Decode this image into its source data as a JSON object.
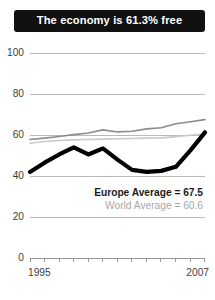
{
  "title": "The economy is 61.3% free",
  "legend": {
    "europe": "Europe Average = 67.5",
    "world": "World Average = 60.6"
  },
  "axis": {
    "y_ticks": [
      "100",
      "80",
      "60",
      "40",
      "20",
      "0"
    ],
    "x_start_label": "1995",
    "x_end_label": "2007"
  },
  "colors": {
    "title_bar": "#111111",
    "title_text": "#ffffff",
    "country_line": "#000000",
    "europe_line": "#8c8c8c",
    "world_line": "#c9c9c9",
    "gridline": "#b9b9b9",
    "tick_label": "#3d3d3d"
  },
  "chart_data": {
    "type": "line",
    "title": "The economy is 61.3% free",
    "xlabel": "",
    "ylabel": "",
    "xlim": [
      1995,
      2007
    ],
    "ylim": [
      0,
      100
    ],
    "ytick_values": [
      0,
      20,
      40,
      60,
      80,
      100
    ],
    "grid": true,
    "legend_position": "inside-bottom-right",
    "x": [
      1995,
      1996,
      1997,
      1998,
      1999,
      2000,
      2001,
      2002,
      2003,
      2004,
      2005,
      2006,
      2007
    ],
    "series": [
      {
        "name": "Country",
        "color": "#000000",
        "width": "thick",
        "values": [
          42.0,
          46.5,
          50.5,
          54.0,
          50.5,
          53.5,
          48.0,
          43.0,
          42.0,
          42.5,
          44.5,
          52.5,
          61.3
        ]
      },
      {
        "name": "Europe Average",
        "color": "#8c8c8c",
        "width": "thin",
        "annotation": "Europe Average = 67.5",
        "values": [
          57.8,
          58.5,
          59.3,
          60.2,
          61.0,
          62.5,
          61.5,
          61.8,
          63.0,
          63.5,
          65.5,
          66.5,
          67.5
        ]
      },
      {
        "name": "World Average",
        "color": "#c9c9c9",
        "width": "thin",
        "annotation": "World Average = 60.6",
        "values": [
          56.0,
          56.8,
          57.3,
          57.6,
          57.8,
          58.0,
          58.2,
          58.3,
          58.5,
          58.6,
          59.2,
          59.9,
          60.6
        ]
      }
    ]
  }
}
